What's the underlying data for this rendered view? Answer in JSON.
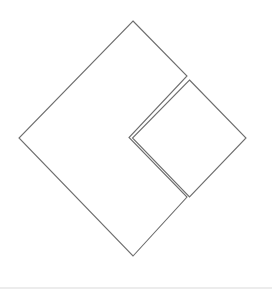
{
  "diagram": {
    "stroke_color": "#6e6e6e",
    "background_color": "#ffffff",
    "shapes": [
      {
        "id": "notched-large-square",
        "kind": "polygon",
        "label": ""
      },
      {
        "id": "small-square",
        "kind": "polygon",
        "label": ""
      }
    ]
  }
}
